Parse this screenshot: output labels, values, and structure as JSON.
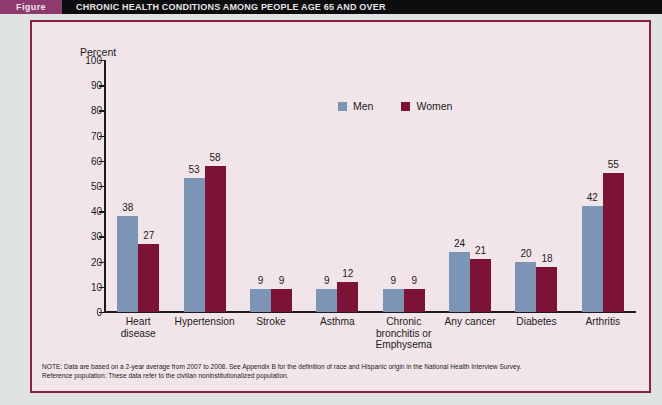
{
  "banner": {
    "figure_tag": "Figure",
    "title": "CHRONIC HEALTH CONDITIONS AMONG PEOPLE AGE 65 AND OVER",
    "tag_color": "#8e3a6e",
    "bar_color": "#0d0c0e"
  },
  "source": {
    "line1": "Source: Centers for Disease Control and Prevention. (2010). Aging statistics. Retrieved from",
    "line2": "http://www.agingstats.gov/Main_Site/Data/2010_Documents/docs/Health_Status.pdf"
  },
  "note": {
    "line1": "NOTE: Data are based on a 2-year average from 2007 to 2008. See Appendix B for the definition of race and Hispanic origin in the National Health Interview Survey.",
    "line2": "Reference population: These data refer to the civilian noninstitutionalized population."
  },
  "colors": {
    "men": "#7c95b4",
    "women": "#7c1235",
    "frame_border": "#8c1f45",
    "plot_background": "#f2e5e9",
    "page_background": "#dfe3e2",
    "axis": "#1b1b1b"
  },
  "chart_data": {
    "type": "bar",
    "title": "CHRONIC HEALTH CONDITIONS AMONG PEOPLE AGE 65 AND OVER",
    "xlabel": "",
    "ylabel": "Percent",
    "ylim": [
      0,
      100
    ],
    "yticks": [
      0,
      10,
      20,
      30,
      40,
      50,
      60,
      70,
      80,
      90,
      100
    ],
    "ytick_labels": [
      "0",
      "10",
      "20",
      "30",
      "40",
      "50",
      "60",
      "70",
      "80",
      "90",
      "100"
    ],
    "grid": false,
    "legend_position": "top-center",
    "categories": [
      "Heart disease",
      "Hypertension",
      "Stroke",
      "Asthma",
      "Chronic bronchitis or Emphysema",
      "Any cancer",
      "Diabetes",
      "Arthritis"
    ],
    "category_lines": [
      [
        "Heart",
        "disease"
      ],
      [
        "Hypertension"
      ],
      [
        "Stroke"
      ],
      [
        "Asthma"
      ],
      [
        "Chronic",
        "bronchitis or",
        "Emphysema"
      ],
      [
        "Any cancer"
      ],
      [
        "Diabetes"
      ],
      [
        "Arthritis"
      ]
    ],
    "series": [
      {
        "name": "Men",
        "color": "#7c95b4",
        "values": [
          38,
          53,
          9,
          9,
          9,
          24,
          20,
          42
        ]
      },
      {
        "name": "Women",
        "color": "#7c1235",
        "values": [
          27,
          58,
          9,
          12,
          9,
          21,
          18,
          55
        ]
      }
    ]
  }
}
